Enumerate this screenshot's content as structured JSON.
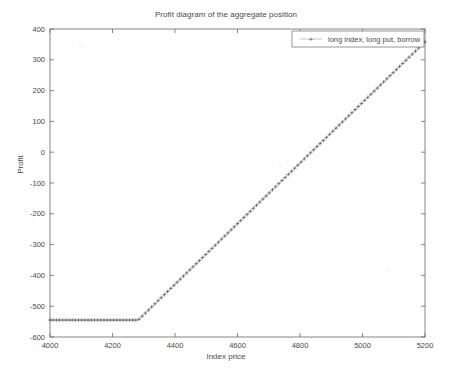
{
  "chart_data": {
    "type": "line",
    "title": "Profit diagram of the aggregate position",
    "xlabel": "Index price",
    "ylabel": "Profit",
    "xlim": [
      4000,
      5200
    ],
    "ylim": [
      -600,
      400
    ],
    "xticks": [
      4000,
      4200,
      4400,
      4600,
      4800,
      5000,
      5200
    ],
    "xtick_labels": [
      "4000",
      "4200",
      "4400",
      "4600",
      "4800",
      "5000",
      "5200"
    ],
    "yticks": [
      -600,
      -500,
      -400,
      -300,
      -200,
      -100,
      0,
      100,
      200,
      300,
      400
    ],
    "ytick_labels": [
      "-600",
      "-500",
      "-400",
      "-300",
      "-200",
      "-100",
      "0",
      "100",
      "200",
      "300",
      "400"
    ],
    "grid": false,
    "legend_position": "upper-right",
    "marker": "+",
    "marker_label": "+",
    "series": [
      {
        "name": "long index, long put, borrow",
        "color": "#3c3c3c",
        "breakpoint_x": 4282,
        "floor_value": -545,
        "slope_above_breakpoint": 0.984,
        "x": [
          4000,
          4020,
          4040,
          4060,
          4080,
          4100,
          4120,
          4140,
          4160,
          4180,
          4200,
          4220,
          4240,
          4260,
          4282,
          4300,
          4320,
          4340,
          4360,
          4380,
          4400,
          4420,
          4440,
          4460,
          4480,
          4500,
          4520,
          4540,
          4560,
          4580,
          4600,
          4620,
          4640,
          4660,
          4680,
          4700,
          4720,
          4740,
          4760,
          4780,
          4800,
          4820,
          4840,
          4860,
          4880,
          4900,
          4920,
          4940,
          4960,
          4980,
          5000,
          5020,
          5040,
          5060,
          5080,
          5100,
          5120,
          5140,
          5160,
          5180,
          5200
        ],
        "y": [
          -545,
          -545,
          -545,
          -545,
          -545,
          -545,
          -545,
          -545,
          -545,
          -545,
          -545,
          -545,
          -545,
          -545,
          -545,
          -527,
          -508,
          -488,
          -468,
          -449,
          -429,
          -410,
          -390,
          -370,
          -351,
          -331,
          -311,
          -292,
          -272,
          -253,
          -233,
          -213,
          -194,
          -174,
          -154,
          -135,
          -115,
          -96,
          -76,
          -56,
          -37,
          -17,
          3,
          22,
          42,
          61,
          81,
          101,
          120,
          140,
          160,
          179,
          199,
          218,
          238,
          258,
          277,
          297,
          317,
          336,
          356
        ]
      }
    ],
    "annotations": []
  },
  "legend": {
    "entries": [
      {
        "marker": "+",
        "label": "long index, long put, borrow"
      }
    ]
  }
}
